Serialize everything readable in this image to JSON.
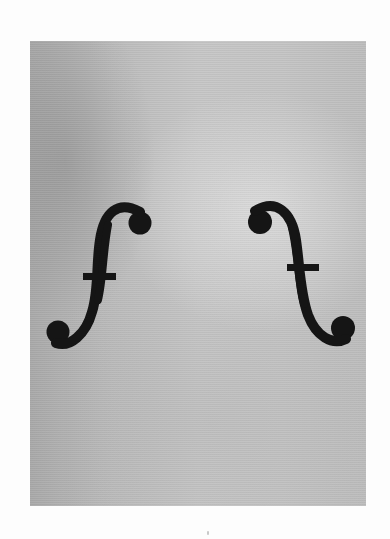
{
  "image": {
    "subject": "violin f-holes on a gray textured background",
    "description": "Photograph of a pair of mirrored violin sound holes (f-holes) cut into a pale gray surface",
    "colors": {
      "page_background": "#fdfdfd",
      "panel_gray": "#c0c0c0",
      "panel_shadow": "#a9a9a9",
      "f_hole_fill": "#151515"
    },
    "elements": [
      {
        "name": "left-f-hole",
        "shape": "f"
      },
      {
        "name": "right-f-hole",
        "shape": "mirrored f"
      }
    ]
  }
}
